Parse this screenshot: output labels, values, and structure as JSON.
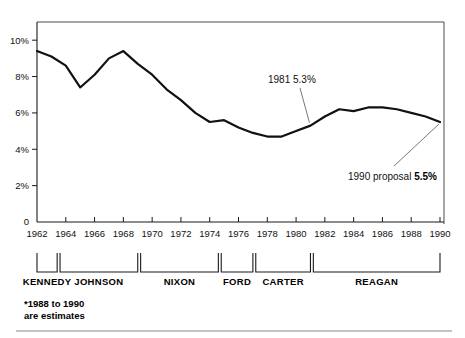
{
  "chart_data": {
    "type": "line",
    "title": "",
    "subtitle": "",
    "xlabel": "",
    "ylabel": "",
    "xlim": [
      1962,
      1990
    ],
    "ylim": [
      0,
      11
    ],
    "grid": false,
    "legend_position": "none",
    "x": [
      1962,
      1963,
      1964,
      1965,
      1966,
      1967,
      1968,
      1969,
      1970,
      1971,
      1972,
      1973,
      1974,
      1975,
      1976,
      1977,
      1978,
      1979,
      1980,
      1981,
      1982,
      1983,
      1984,
      1985,
      1986,
      1987,
      1988,
      1989,
      1990
    ],
    "series": [
      {
        "name": "Defense spending as share of GNP",
        "values": [
          9.4,
          9.1,
          8.6,
          7.4,
          8.1,
          9.0,
          9.4,
          8.7,
          8.1,
          7.3,
          6.7,
          6.0,
          5.5,
          5.6,
          5.2,
          4.9,
          4.7,
          4.7,
          5.0,
          5.3,
          5.8,
          6.2,
          6.1,
          6.3,
          6.3,
          6.2,
          6.0,
          5.8,
          5.5
        ]
      }
    ],
    "ytick_labels": [
      "10%",
      "8%",
      "6%",
      "4%",
      "2%",
      "0"
    ],
    "ytick_values": [
      10,
      8,
      6,
      4,
      2,
      0
    ],
    "xtick_labels": [
      "1962",
      "1964",
      "1966",
      "1968",
      "1970",
      "1972",
      "1974",
      "1976",
      "1978",
      "1980",
      "1982",
      "1984",
      "1986",
      "1988",
      "1990"
    ],
    "xtick_values": [
      1962,
      1964,
      1966,
      1968,
      1970,
      1972,
      1974,
      1976,
      1978,
      1980,
      1982,
      1984,
      1986,
      1988,
      1990
    ],
    "annotations": [
      {
        "id": "annot-1981",
        "label": "1981 5.3%",
        "label_plain": "1981 5.3%",
        "year": 1981,
        "value": 5.3
      },
      {
        "id": "annot-1990",
        "label_prefix": "1990 proposal ",
        "label_bold": "5.5%",
        "year": 1990,
        "value": 5.5
      }
    ]
  },
  "presidents": [
    {
      "name": "KENNEDY",
      "start": 1962,
      "end": 1963.4
    },
    {
      "name": "JOHNSON",
      "start": 1963.6,
      "end": 1969.0
    },
    {
      "name": "NIXON",
      "start": 1969.2,
      "end": 1974.6
    },
    {
      "name": "FORD",
      "start": 1974.8,
      "end": 1977.0
    },
    {
      "name": "CARTER",
      "start": 1977.2,
      "end": 1981.0
    },
    {
      "name": "REAGAN",
      "start": 1981.2,
      "end": 1990.0
    }
  ],
  "footnote": {
    "line1": "*1988 to 1990",
    "line2": "are estimates"
  },
  "colors": {
    "line": "#111111",
    "axis": "#1a1a1a",
    "frame": "#4a4a4a",
    "text": "#111111",
    "leader": "#555555",
    "background": "#ffffff"
  }
}
